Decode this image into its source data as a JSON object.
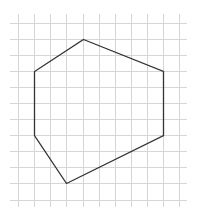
{
  "diagram": {
    "grid": {
      "columns_x": [
        18,
        34,
        50,
        66,
        83,
        99,
        115,
        131,
        147,
        163,
        179
      ],
      "rows_y": [
        23,
        39,
        55,
        71,
        87,
        103,
        119,
        135,
        151,
        167,
        183,
        200
      ],
      "v_line_top": 14,
      "v_line_bottom": 207,
      "h_line_left": 10,
      "h_line_right": 187,
      "line_color": "#d6d6d6"
    },
    "polygon": {
      "name": "hexagon",
      "vertices_grid": [
        [
          4,
          1
        ],
        [
          9,
          3
        ],
        [
          9,
          7
        ],
        [
          3,
          10
        ],
        [
          1,
          7
        ],
        [
          1,
          3
        ]
      ],
      "vertices_px": [
        [
          83,
          39
        ],
        [
          163,
          71
        ],
        [
          163,
          135
        ],
        [
          66,
          183
        ],
        [
          34,
          135
        ],
        [
          34,
          71
        ]
      ],
      "stroke_color": "#333333",
      "stroke_width": 1.3
    }
  }
}
